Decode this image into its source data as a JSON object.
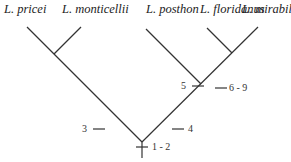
{
  "diagram": {
    "type": "cladogram",
    "taxa": [
      "L. pricei",
      "L. monticellii",
      "L. posthon",
      "L. floridanus",
      "L. mirabilis"
    ],
    "character_changes": {
      "root": "1 - 2",
      "pricei_monticellii_clade": "3",
      "posthon_floridanus_mirabilis_clade": "4",
      "posthon_branch": "5",
      "floridanus_mirabilis_clade": "6 - 9"
    }
  }
}
